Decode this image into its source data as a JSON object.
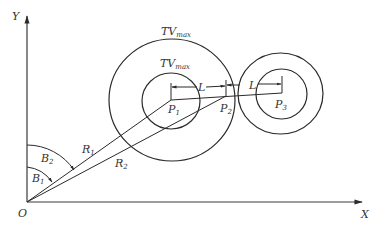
{
  "diagram": {
    "axes": {
      "origin_label": "O",
      "x_label": "X",
      "y_label": "Y"
    },
    "circles": {
      "outer_label_main": "TV",
      "outer_label_sub": "max",
      "inner_label_main": "TV",
      "inner_label_sub": "max"
    },
    "points": {
      "p1_main": "P",
      "p1_sub": "1",
      "p2_main": "P",
      "p2_sub": "2",
      "p3_main": "P",
      "p3_sub": "3"
    },
    "segments": {
      "l1": "L",
      "l2": "L"
    },
    "radii": {
      "r1_main": "R",
      "r1_sub": "1",
      "r2_main": "R",
      "r2_sub": "2"
    },
    "angles": {
      "b1_main": "B",
      "b1_sub": "1",
      "b2_main": "B",
      "b2_sub": "2"
    },
    "colors": {
      "stroke": "#2a2a2a",
      "background": "#ffffff"
    }
  }
}
